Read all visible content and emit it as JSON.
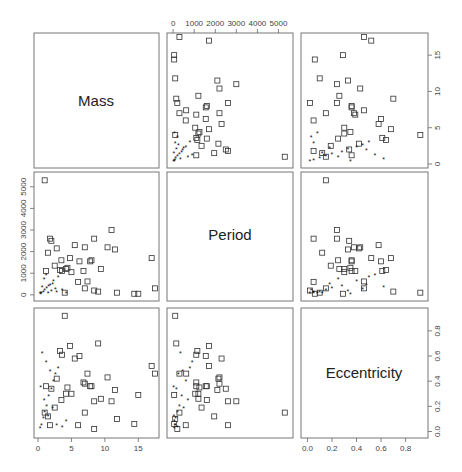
{
  "chart_data": {
    "type": "scatter",
    "title": "",
    "variables": [
      "Mass",
      "Period",
      "Eccentricity"
    ],
    "layout": "pairs scatterplot matrix 3x3",
    "markers": {
      "open_square": "group A (larger masses)",
      "filled_star": "group B (small masses)"
    },
    "axes": {
      "Mass": {
        "ticks": [
          0,
          5,
          10,
          15
        ],
        "range": [
          0,
          17.5
        ]
      },
      "Period": {
        "ticks": [
          0,
          1000,
          2000,
          3000,
          4000,
          5000
        ],
        "range": [
          -100,
          5500
        ]
      },
      "Eccentricity": {
        "ticks": [
          0.0,
          0.2,
          0.4,
          0.6,
          0.8
        ],
        "range": [
          -0.02,
          0.95
        ]
      }
    },
    "axis_tick_labels": {
      "top_period": [
        "0",
        "1000",
        "2000",
        "3000",
        "4000",
        "5000"
      ],
      "right_mass": [
        "0",
        "5",
        "10",
        "15"
      ],
      "left_period": [
        "0",
        "1000",
        "2000",
        "3000",
        "4000",
        "5000"
      ],
      "right_eccentricity": [
        "0.0",
        "0.2",
        "0.4",
        "0.6",
        "0.8"
      ],
      "bottom_mass": [
        "0",
        "5",
        "10",
        "15"
      ],
      "bottom_eccentricity": [
        "0.0",
        "0.2",
        "0.4",
        "0.6",
        "0.8"
      ]
    },
    "points_A": [
      {
        "mass": 17.5,
        "period": 300,
        "ecc": 0.46
      },
      {
        "mass": 17.0,
        "period": 1700,
        "ecc": 0.52
      },
      {
        "mass": 14.4,
        "period": 50,
        "ecc": 0.06
      },
      {
        "mass": 11.0,
        "period": 3000,
        "ecc": 0.24
      },
      {
        "mass": 11.5,
        "period": 2100,
        "ecc": 0.33
      },
      {
        "mass": 10.4,
        "period": 2200,
        "ecc": 0.43
      },
      {
        "mass": 9.4,
        "period": 1200,
        "ecc": 0.26
      },
      {
        "mass": 8.4,
        "period": 2600,
        "ecc": 0.24
      },
      {
        "mass": 8.0,
        "period": 1600,
        "ecc": 0.36
      },
      {
        "mass": 7.8,
        "period": 1550,
        "ecc": 0.36
      },
      {
        "mass": 7.4,
        "period": 620,
        "ecc": 0.46
      },
      {
        "mass": 7.0,
        "period": 2200,
        "ecc": 0.38
      },
      {
        "mass": 6.8,
        "period": 1100,
        "ecc": 0.39
      },
      {
        "mass": 6.2,
        "period": 1550,
        "ecc": 0.6
      },
      {
        "mass": 5.5,
        "period": 2300,
        "ecc": 0.58
      },
      {
        "mass": 5.0,
        "period": 1050,
        "ecc": 0.3
      },
      {
        "mass": 4.8,
        "period": 1700,
        "ecc": 0.68
      },
      {
        "mass": 4.4,
        "period": 1250,
        "ecc": 0.35
      },
      {
        "mass": 4.2,
        "period": 1200,
        "ecc": 0.3
      },
      {
        "mass": 3.6,
        "period": 1100,
        "ecc": 0.61
      },
      {
        "mass": 3.5,
        "period": 1600,
        "ecc": 0.25
      },
      {
        "mass": 3.3,
        "period": 1150,
        "ecc": 0.64
      },
      {
        "mass": 2.8,
        "period": 2150,
        "ecc": 0.42
      },
      {
        "mass": 2.5,
        "period": 1350,
        "ecc": 0.19
      },
      {
        "mass": 2.0,
        "period": 2500,
        "ecc": 0.34
      },
      {
        "mass": 1.8,
        "period": 2600,
        "ecc": 0.05
      },
      {
        "mass": 1.5,
        "period": 1950,
        "ecc": 0.12
      },
      {
        "mass": 1.2,
        "period": 1100,
        "ecc": 0.36
      },
      {
        "mass": 1.0,
        "period": 5300,
        "ecc": 0.15
      },
      {
        "mass": 4.0,
        "period": 100,
        "ecc": 0.92
      },
      {
        "mass": 6.0,
        "period": 600,
        "ecc": 0.05
      },
      {
        "mass": 7.0,
        "period": 300,
        "ecc": 0.15
      },
      {
        "mass": 8.4,
        "period": 200,
        "ecc": 0.02
      },
      {
        "mass": 9.0,
        "period": 150,
        "ecc": 0.7
      },
      {
        "mass": 11.8,
        "period": 100,
        "ecc": 0.1
      },
      {
        "mass": 15.0,
        "period": 50,
        "ecc": 0.29
      }
    ],
    "points_B": [
      {
        "mass": 0.3,
        "period": 50,
        "ecc": 0.02
      },
      {
        "mass": 0.5,
        "period": 80,
        "ecc": 0.05
      },
      {
        "mass": 0.8,
        "period": 120,
        "ecc": 0.1
      },
      {
        "mass": 1.0,
        "period": 200,
        "ecc": 0.15
      },
      {
        "mass": 1.3,
        "period": 300,
        "ecc": 0.2
      },
      {
        "mass": 1.6,
        "period": 400,
        "ecc": 0.28
      },
      {
        "mass": 2.0,
        "period": 150,
        "ecc": 0.33
      },
      {
        "mass": 2.3,
        "period": 600,
        "ecc": 0.4
      },
      {
        "mass": 2.6,
        "period": 250,
        "ecc": 0.45
      },
      {
        "mass": 3.0,
        "period": 800,
        "ecc": 0.5
      },
      {
        "mass": 1.2,
        "period": 900,
        "ecc": 0.55
      },
      {
        "mass": 0.6,
        "period": 350,
        "ecc": 0.62
      },
      {
        "mass": 1.8,
        "period": 450,
        "ecc": 0.48
      },
      {
        "mass": 2.8,
        "period": 100,
        "ecc": 0.05
      },
      {
        "mass": 3.6,
        "period": 200,
        "ecc": 0.03
      },
      {
        "mass": 4.2,
        "period": 60,
        "ecc": 0.08
      },
      {
        "mass": 0.9,
        "period": 700,
        "ecc": 0.25
      },
      {
        "mass": 1.5,
        "period": 40,
        "ecc": 0.12
      },
      {
        "mass": 2.2,
        "period": 500,
        "ecc": 0.18
      },
      {
        "mass": 0.4,
        "period": 30,
        "ecc": 0.35
      }
    ]
  },
  "panels": {
    "diag_mass": "Mass",
    "diag_period": "Period",
    "diag_ecc": "Eccentricity"
  }
}
